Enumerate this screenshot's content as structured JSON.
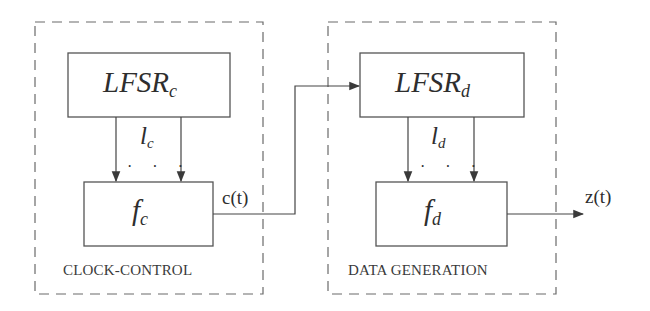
{
  "diagram": {
    "type": "block-diagram",
    "groups": [
      {
        "id": "clock_control",
        "label": "CLOCK-CONTROL",
        "blocks": [
          {
            "id": "lfsr_c",
            "main": "LFSR",
            "sub": "c"
          },
          {
            "id": "f_c",
            "main": "f",
            "sub": "c"
          }
        ],
        "connection_label": {
          "main": "l",
          "sub": "c"
        },
        "ellipsis": "· · ·"
      },
      {
        "id": "data_generation",
        "label": "DATA GENERATION",
        "blocks": [
          {
            "id": "lfsr_d",
            "main": "LFSR",
            "sub": "d"
          },
          {
            "id": "f_d",
            "main": "f",
            "sub": "d"
          }
        ],
        "connection_label": {
          "main": "l",
          "sub": "d"
        },
        "ellipsis": "· · ·"
      }
    ],
    "signals": {
      "clock_signal": "c(t)",
      "output_signal": "z(t)"
    },
    "edges": [
      {
        "from": "lfsr_c",
        "to": "f_c",
        "label": "l_c"
      },
      {
        "from": "f_c",
        "to": "lfsr_d",
        "label": "c(t)"
      },
      {
        "from": "lfsr_d",
        "to": "f_d",
        "label": "l_d"
      },
      {
        "from": "f_d",
        "to": "output",
        "label": "z(t)"
      }
    ],
    "colors": {
      "stroke": "#4a4a4a",
      "dashed_border": "#6a6a6a",
      "text": "#2e2e2e",
      "background": "#ffffff"
    }
  }
}
